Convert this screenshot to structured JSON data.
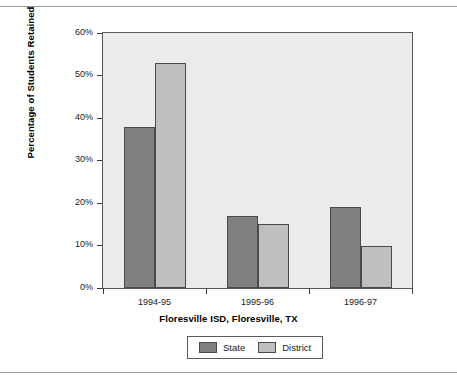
{
  "chart_data": {
    "type": "bar",
    "title": "",
    "xlabel": "Floresville ISD, Floresville, TX",
    "ylabel": "Percentage of Students Retained",
    "categories": [
      "1994-95",
      "1995-96",
      "1996-97"
    ],
    "series": [
      {
        "name": "State",
        "values": [
          38,
          17,
          19
        ],
        "color": "#808080"
      },
      {
        "name": "District",
        "values": [
          53,
          15,
          10
        ],
        "color": "#bfbfbf"
      }
    ],
    "ylim": [
      0,
      60
    ],
    "ytick_values": [
      0,
      10,
      20,
      30,
      40,
      50,
      60
    ],
    "ytick_labels": [
      "0%",
      "10%",
      "20%",
      "30%",
      "40%",
      "50%",
      "60%"
    ],
    "grid": false,
    "legend_position": "bottom",
    "plot_background": "#ebebeb",
    "figure_background": "#ffffff",
    "axis_color": "#595959"
  },
  "axes": {
    "y_label": "Percentage of Students Retained",
    "x_label": "Floresville ISD, Floresville, TX"
  },
  "legend": {
    "items": [
      {
        "label": "State"
      },
      {
        "label": "District"
      }
    ]
  }
}
